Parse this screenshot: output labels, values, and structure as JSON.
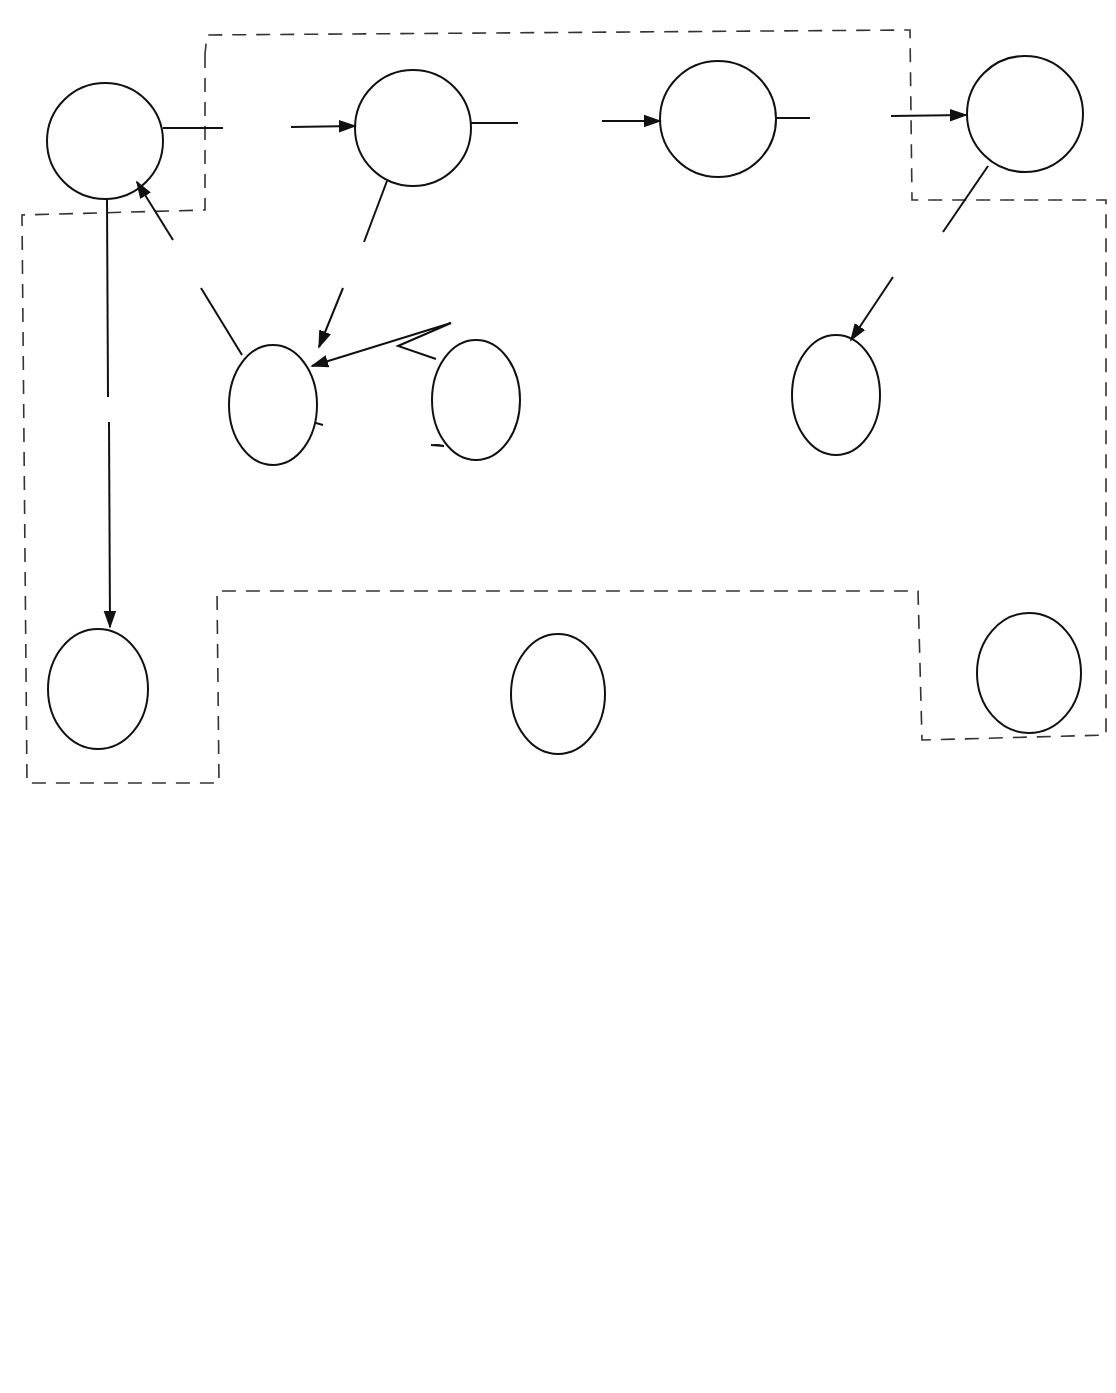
{
  "page": {
    "header": "Sec. 2.5      SURVEY OF TECHNIQUES"
  },
  "diagram_a": {
    "caption": "(a)",
    "nodes": {
      "customer": "Customer",
      "sales": "Sales",
      "purchasing": "Purchasing",
      "supplier": "Supplier",
      "shipping_1": "Shipping",
      "shipping_2": "Department",
      "inventory": "Inventory",
      "receiving_1": "Receiving",
      "receiving_2": "Department",
      "ar_1": "Accounts",
      "ar_2": "Receivable",
      "bank": "Bank",
      "ap_1": "Accounts",
      "ap_2": "Payable"
    },
    "flows": {
      "orders": "Orders",
      "order_details_1a": "Order",
      "order_details_1b": "Details",
      "purchase_orders_a": "Purchase",
      "purchase_orders_b": "Orders",
      "ship_pack_cust_a": "Shipment and",
      "ship_pack_cust_b": "Packing Slip",
      "order_details_2a": "Order",
      "order_details_2b": "Details",
      "ship_pack_sup_a": "Shipment and",
      "ship_pack_sup_b": "Packing Slip",
      "payments": "Payments",
      "widgets_inv_ship": "Widgets",
      "order_ship_inv": "Order",
      "widgets_recv_inv": "Widgets",
      "checks": "Checks",
      "invoice": "Invoice",
      "shipment_details_a": "Shipment",
      "shipment_details_b": "Details",
      "receipts": "Receipts",
      "deposits": "Deposits",
      "withdrawals": "Withdrawals"
    }
  },
  "diagram_b": {
    "caption": "(b)",
    "nodes": {
      "customer": "Customer",
      "org_1": "The",
      "org_2": "Organization",
      "supplier": "Supplier",
      "bank": "Bank"
    },
    "flows": {
      "orders": "Orders",
      "payments": "Payments",
      "ship_pack_cust_a": "Shipment and",
      "ship_pack_cust_b": "Packing Slip",
      "purchase_orders_a": "Purchase",
      "purchase_orders_b": "Orders",
      "checks": "Checks",
      "ship_pack_sup_a": "Shipment and",
      "ship_pack_sup_b": "Packing Slip",
      "deposits": "Deposits",
      "receipts": "Receipts",
      "withdrawals": "Withdrawals"
    }
  }
}
